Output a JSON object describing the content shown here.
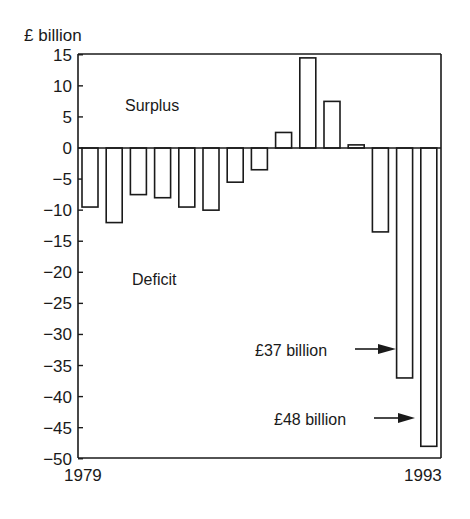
{
  "chart_data": {
    "type": "bar",
    "title": "",
    "ylabel": "£ billion",
    "xlabel": "",
    "ylim": [
      -50,
      15
    ],
    "yticks": [
      15,
      10,
      5,
      0,
      -5,
      -10,
      -15,
      -20,
      -25,
      -30,
      -35,
      -40,
      -45,
      -50
    ],
    "ytick_labels": [
      "15",
      "10",
      "5",
      "0",
      "−5",
      "−10",
      "−15",
      "−20",
      "−25",
      "−30",
      "−35",
      "−40",
      "−45",
      "−50"
    ],
    "x_first_label": "1979",
    "x_last_label": "1993",
    "categories": [
      "1979",
      "1980",
      "1981",
      "1982",
      "1983",
      "1984",
      "1985",
      "1986",
      "1987",
      "1988",
      "1989",
      "1990",
      "1991",
      "1992",
      "1993"
    ],
    "values": [
      -9.5,
      -12,
      -7.5,
      -8,
      -9.5,
      -10,
      -5.5,
      -3.5,
      2.5,
      14.5,
      7.5,
      0.5,
      -13.5,
      -37,
      -48
    ],
    "grid": false,
    "legend": null,
    "annotations": [
      {
        "text": "Surplus",
        "region": "positive"
      },
      {
        "text": "Deficit",
        "region": "negative"
      },
      {
        "text": "£37 billion",
        "points_to": "1992",
        "value": -37
      },
      {
        "text": "£48 billion",
        "points_to": "1993",
        "value": -48
      }
    ]
  },
  "labels": {
    "y_unit": "£ billion",
    "surplus": "Surplus",
    "deficit": "Deficit",
    "annot_37": "£37 billion",
    "annot_48": "£48 billion",
    "x_start": "1979",
    "x_end": "1993"
  },
  "colors": {
    "line": "#1a1a1a",
    "bar_fill": "#ffffff",
    "background": "#ffffff"
  }
}
